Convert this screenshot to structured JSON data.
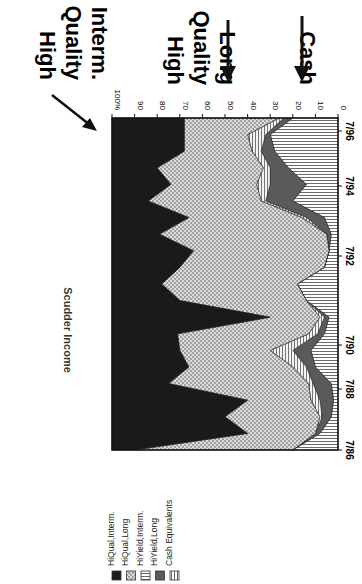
{
  "chart_data": {
    "type": "area",
    "stacked": true,
    "normalized_percent": true,
    "orientation_note": "image rotated 90 degrees clockwise",
    "title": "Scudder Income",
    "xlabel": "",
    "ylabel": "",
    "ylim": [
      0,
      100
    ],
    "y_ticks": [
      "0",
      "10",
      "20",
      "30",
      "40",
      "50",
      "60",
      "70",
      "80",
      "90",
      "100%"
    ],
    "x_ticks": [
      "7/86",
      "7/88",
      "7/90",
      "7/92",
      "7/94",
      "7/96"
    ],
    "x": [
      "7/86",
      "1/87",
      "7/87",
      "1/88",
      "7/88",
      "1/89",
      "7/89",
      "1/90",
      "7/90",
      "1/91",
      "7/91",
      "1/92",
      "7/92",
      "1/93",
      "7/93",
      "1/94",
      "7/94",
      "1/95",
      "7/95",
      "1/96",
      "7/96"
    ],
    "series": [
      {
        "name": "Cash Equivalents",
        "pattern": "vertical-lines",
        "values": [
          20,
          8,
          3,
          2,
          3,
          10,
          12,
          6,
          4,
          14,
          18,
          6,
          4,
          3,
          6,
          20,
          14,
          22,
          28,
          30,
          20
        ]
      },
      {
        "name": "HiYield,Long",
        "pattern": "dark-gray",
        "values": [
          0,
          2,
          4,
          6,
          8,
          4,
          8,
          3,
          2,
          0,
          0,
          0,
          0,
          2,
          8,
          12,
          16,
          8,
          6,
          2,
          4
        ]
      },
      {
        "name": "HiYield,Interm.",
        "pattern": "horizontal-lines",
        "values": [
          0,
          0,
          1,
          4,
          2,
          6,
          10,
          4,
          2,
          0,
          0,
          0,
          0,
          0,
          2,
          2,
          6,
          3,
          4,
          8,
          2
        ]
      },
      {
        "name": "HiQual,Long",
        "pattern": "dotted",
        "values": [
          70,
          30,
          42,
          28,
          62,
          46,
          40,
          58,
          22,
          56,
          60,
          64,
          60,
          74,
          50,
          50,
          38,
          47,
          30,
          28,
          42
        ]
      },
      {
        "name": "HiQual,Interm.",
        "pattern": "black",
        "values": [
          10,
          60,
          50,
          60,
          25,
          34,
          30,
          29,
          70,
          30,
          22,
          30,
          36,
          21,
          34,
          16,
          26,
          20,
          32,
          32,
          32
        ]
      }
    ],
    "annotations": [
      {
        "text": "High Quality Interm.",
        "arrow": true
      },
      {
        "text": "High Quality Long",
        "arrow": true
      },
      {
        "text": "Cash",
        "arrow": true
      }
    ],
    "legend_position": "bottom-left (rotated)",
    "grid": false
  },
  "legend": {
    "items": [
      {
        "label": "HiQual,Interm.",
        "swatch": "black"
      },
      {
        "label": "HiQual,Long",
        "swatch": "dotted"
      },
      {
        "label": "HiYield,Interm.",
        "swatch": "horizontal-lines"
      },
      {
        "label": "HiYield,Long",
        "swatch": "dark-gray"
      },
      {
        "label": "Cash Equivalents",
        "swatch": "vertical-lines"
      }
    ]
  },
  "annotations": {
    "hq_interm": [
      "High",
      "Quality",
      "Interm."
    ],
    "hq_long": [
      "High",
      "Quality",
      "Long"
    ],
    "cash": [
      "Cash"
    ]
  },
  "colors": {
    "black": "#1a1a1a",
    "dark_gray": "#5a5a5a",
    "dotted_bg": "#d8d8d8",
    "line": "#222222"
  }
}
